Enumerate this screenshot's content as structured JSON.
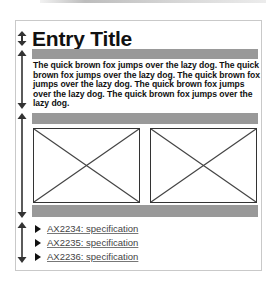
{
  "entry": {
    "title": "Entry Title",
    "body": "The quick brown fox jumps over the lazy dog. The quick brown fox jumps over the lazy dog. The quick brown fox jumps over the lazy dog. The quick brown fox jumps over the lazy dog. The quick brown fox jumps over the lazy dog."
  },
  "images": [
    {
      "icon": "image-placeholder-x"
    },
    {
      "icon": "image-placeholder-x"
    }
  ],
  "links": [
    {
      "label": "AX2234: specification",
      "icon": "triangle-right"
    },
    {
      "label": "AX2235: specification",
      "icon": "triangle-right"
    },
    {
      "label": "AX2236: specification",
      "icon": "triangle-right"
    }
  ],
  "colors": {
    "bar": "#999999",
    "frame_border": "#c9c9c9",
    "text": "#111111",
    "link": "#444444",
    "arrow": "#333333"
  }
}
